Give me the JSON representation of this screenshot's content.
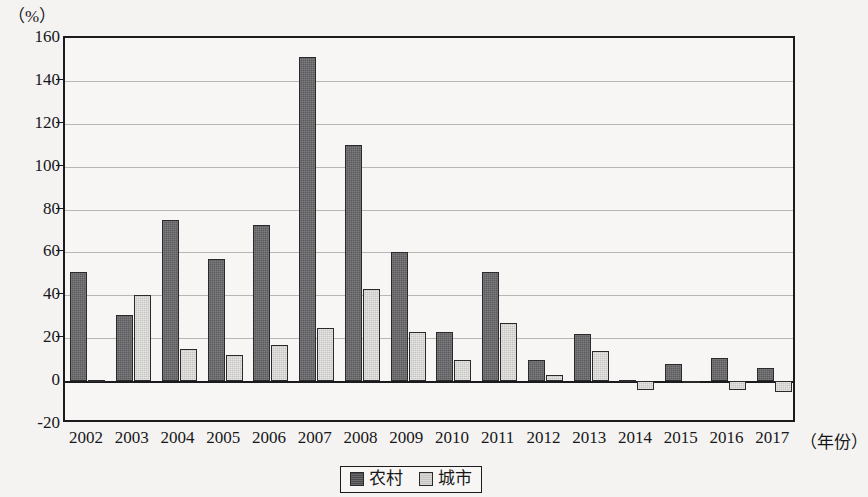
{
  "chart_data": {
    "type": "bar",
    "title": "",
    "subtitle": "",
    "xlabel": "（年份）",
    "ylabel": "（%）",
    "ylim": [
      -20,
      160
    ],
    "ytick_step": 20,
    "grid": true,
    "legend_position": "bottom-center",
    "categories": [
      "2002",
      "2003",
      "2004",
      "2005",
      "2006",
      "2007",
      "2008",
      "2009",
      "2010",
      "2011",
      "2012",
      "2013",
      "2014",
      "2015",
      "2016",
      "2017"
    ],
    "yticks": [
      "160",
      "140",
      "120",
      "100",
      "80",
      "60",
      "40",
      "20",
      "0",
      "-20"
    ],
    "ytick_values": [
      160,
      140,
      120,
      100,
      80,
      60,
      40,
      20,
      0,
      -20
    ],
    "series": [
      {
        "name": "农村",
        "color": "#5c5c5f",
        "values": [
          51,
          31,
          75,
          57,
          73,
          151,
          110,
          60,
          23,
          51,
          10,
          22,
          0.5,
          8,
          11,
          6
        ]
      },
      {
        "name": "城市",
        "color": "#c6c5c2",
        "values": [
          0.5,
          40,
          15,
          12,
          17,
          25,
          43,
          23,
          10,
          27,
          3,
          14,
          -4,
          -1,
          -4,
          -5
        ]
      }
    ]
  },
  "legend": {
    "items": [
      {
        "label": "农村",
        "swatch": "rural-swatch"
      },
      {
        "label": "城市",
        "swatch": "urban-swatch"
      }
    ]
  }
}
